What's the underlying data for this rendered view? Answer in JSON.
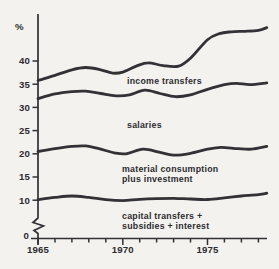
{
  "page": {
    "background_color": "#f3f2ef",
    "line_color": "#333136",
    "text_color": "#2d2c30"
  },
  "chart_data": {
    "type": "line",
    "title": "",
    "ylabel": "%",
    "xlabel": "",
    "grid": false,
    "legend_position": "inline-labels",
    "y_axis": {
      "unit": "%",
      "tick_values": [
        40,
        35,
        30,
        25,
        20,
        15,
        10,
        0
      ],
      "tick_labels": [
        "40",
        "35",
        "30",
        "25",
        "20",
        "15",
        "10",
        "0"
      ],
      "broken_axis_below": 10,
      "range_shown": [
        0,
        50
      ]
    },
    "x_axis": {
      "start_year": 1965,
      "end_year": 1978.5,
      "minor_tick_years": [
        1965,
        1966,
        1967,
        1968,
        1969,
        1970,
        1971,
        1972,
        1973,
        1974,
        1975,
        1976,
        1977,
        1978
      ],
      "labeled_tick_years": [
        1965,
        1970,
        1975
      ],
      "tick_year_labels": [
        "1965",
        "1970",
        "1975"
      ]
    },
    "series": [
      {
        "name": "income-transfers",
        "label_lines": [
          "income transfers"
        ],
        "label_px": {
          "x": 127,
          "y": 84,
          "line_height": 10
        },
        "points": [
          [
            1965,
            35.8
          ],
          [
            1966,
            36.9
          ],
          [
            1967,
            38.1
          ],
          [
            1967.8,
            38.6
          ],
          [
            1968.6,
            38.2
          ],
          [
            1969.4,
            37.4
          ],
          [
            1970,
            37.6
          ],
          [
            1970.8,
            38.9
          ],
          [
            1971.5,
            39.6
          ],
          [
            1972.4,
            39.0
          ],
          [
            1973.3,
            38.9
          ],
          [
            1974,
            40.6
          ],
          [
            1975,
            44.6
          ],
          [
            1975.7,
            45.9
          ],
          [
            1976.4,
            46.3
          ],
          [
            1977.2,
            46.4
          ],
          [
            1978,
            46.6
          ],
          [
            1978.5,
            47.2
          ]
        ]
      },
      {
        "name": "salaries",
        "label_lines": [
          "salaries"
        ],
        "label_px": {
          "x": 127,
          "y": 128,
          "line_height": 10
        },
        "points": [
          [
            1965,
            31.9
          ],
          [
            1966,
            32.9
          ],
          [
            1967,
            33.4
          ],
          [
            1967.8,
            33.5
          ],
          [
            1968.7,
            33.0
          ],
          [
            1969.6,
            32.5
          ],
          [
            1970.4,
            32.7
          ],
          [
            1971.3,
            33.7
          ],
          [
            1972.2,
            33.0
          ],
          [
            1973.1,
            32.3
          ],
          [
            1974,
            32.7
          ],
          [
            1975,
            33.9
          ],
          [
            1976,
            34.9
          ],
          [
            1976.7,
            35.2
          ],
          [
            1977.5,
            34.9
          ],
          [
            1978.5,
            35.3
          ]
        ]
      },
      {
        "name": "material-consumption-plus-investment",
        "label_lines": [
          "material consumption",
          "plus investment"
        ],
        "label_px": {
          "x": 122,
          "y": 172,
          "line_height": 10
        },
        "points": [
          [
            1965,
            20.5
          ],
          [
            1966,
            21.1
          ],
          [
            1967,
            21.6
          ],
          [
            1967.8,
            21.7
          ],
          [
            1968.6,
            21.1
          ],
          [
            1969.5,
            20.2
          ],
          [
            1970.2,
            20.0
          ],
          [
            1971.2,
            21.0
          ],
          [
            1972.2,
            20.3
          ],
          [
            1973.1,
            19.7
          ],
          [
            1974,
            20.1
          ],
          [
            1975,
            21.0
          ],
          [
            1975.8,
            21.4
          ],
          [
            1976.8,
            21.1
          ],
          [
            1977.6,
            21.0
          ],
          [
            1978.5,
            21.6
          ]
        ]
      },
      {
        "name": "capital-transfers-subsidies-interest",
        "label_lines": [
          "capital transfers +",
          "subsidies + interest"
        ],
        "label_px": {
          "x": 122,
          "y": 219,
          "line_height": 10
        },
        "points": [
          [
            1965,
            10.1
          ],
          [
            1966,
            10.6
          ],
          [
            1967,
            10.9
          ],
          [
            1968,
            10.6
          ],
          [
            1969,
            10.1
          ],
          [
            1970,
            9.9
          ],
          [
            1971,
            10.2
          ],
          [
            1972,
            10.35
          ],
          [
            1973,
            10.4
          ],
          [
            1974,
            10.25
          ],
          [
            1975,
            10.15
          ],
          [
            1976,
            10.5
          ],
          [
            1977,
            10.9
          ],
          [
            1978,
            11.2
          ],
          [
            1978.5,
            11.5
          ]
        ]
      }
    ]
  }
}
